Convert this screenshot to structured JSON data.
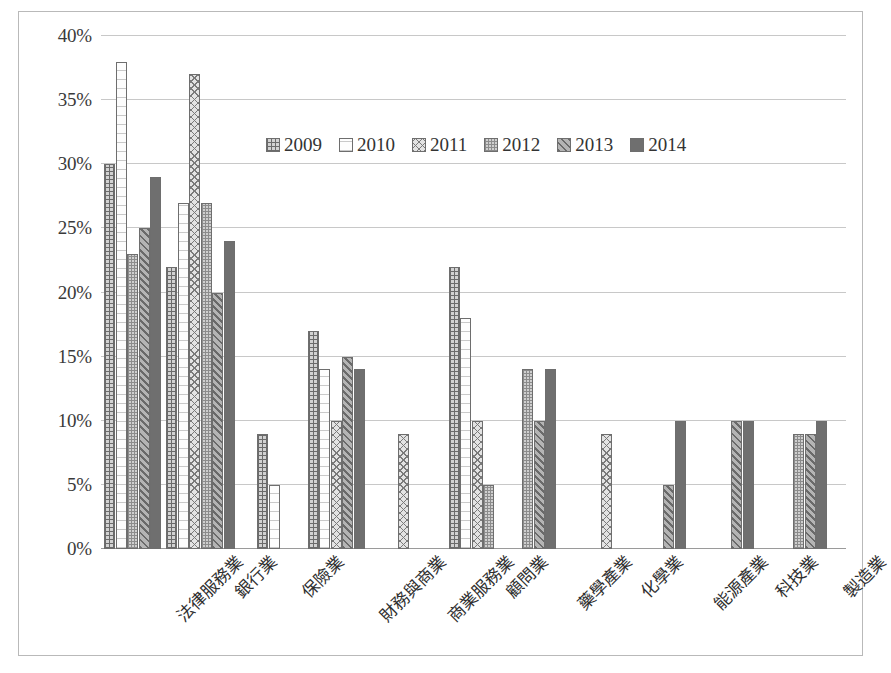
{
  "chart_data": {
    "type": "bar",
    "title": "",
    "xlabel": "",
    "ylabel": "",
    "ylim": [
      0,
      40
    ],
    "ytick_values": [
      0,
      5,
      10,
      15,
      20,
      25,
      30,
      35,
      40
    ],
    "ytick_labels": [
      "0%",
      "5%",
      "10%",
      "15%",
      "20%",
      "25%",
      "30%",
      "35%",
      "40%"
    ],
    "grid": true,
    "legend_position": "upper-center",
    "value_unit": "%",
    "categories": [
      "法律服務業",
      "銀行業",
      "保險業",
      "財務與商業",
      "商業服務業",
      "顧問業",
      "藥學產業",
      "化學業",
      "能源產業",
      "科技業",
      "製造業"
    ],
    "series": [
      {
        "name": "2009",
        "color": "#d2d2d2",
        "pattern": "grid-hatch",
        "values": [
          30,
          22,
          9,
          17,
          null,
          22,
          null,
          null,
          null,
          null,
          null
        ]
      },
      {
        "name": "2010",
        "color": "#fdfdfd",
        "pattern": "light-horizontal",
        "values": [
          38,
          27,
          5,
          14,
          null,
          18,
          null,
          null,
          null,
          null,
          null
        ]
      },
      {
        "name": "2011",
        "color": "#e3e3e3",
        "pattern": "cross-diagonal",
        "values": [
          null,
          37,
          null,
          10,
          9,
          10,
          null,
          9,
          null,
          null,
          null
        ]
      },
      {
        "name": "2012",
        "color": "#cfcfcf",
        "pattern": "fine-grid",
        "values": [
          23,
          27,
          null,
          null,
          null,
          5,
          14,
          null,
          null,
          null,
          9
        ]
      },
      {
        "name": "2013",
        "color": "#b4b4b4",
        "pattern": "diagonal-stripe",
        "values": [
          25,
          20,
          null,
          15,
          null,
          null,
          10,
          null,
          5,
          10,
          9
        ]
      },
      {
        "name": "2014",
        "color": "#6f6f6f",
        "pattern": "solid",
        "values": [
          29,
          24,
          null,
          14,
          null,
          null,
          14,
          null,
          10,
          10,
          10
        ]
      }
    ]
  }
}
